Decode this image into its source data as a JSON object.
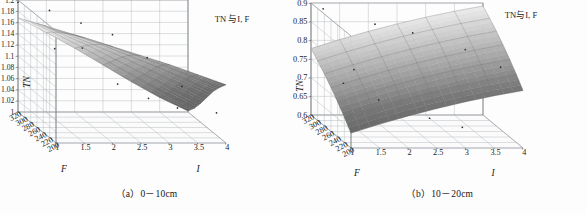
{
  "figure": {
    "background_color": "#fdfdfd",
    "panel_count": 2
  },
  "panels": [
    {
      "id": "a",
      "caption": "（a）0－10cm",
      "title": "TN 与I, F",
      "z_label": "TN",
      "x_label": "I",
      "y_label": "F"
    },
    {
      "id": "b",
      "caption": "（b）10－20cm",
      "title": "TN与I, F",
      "z_label": "TN",
      "x_label": "I",
      "y_label": "F"
    }
  ],
  "chart_data": [
    {
      "type": "surface",
      "panel": "a",
      "title": "TN 与I, F",
      "caption": "（a）0－10cm",
      "xlabel": "I",
      "ylabel": "F",
      "zlabel": "TN",
      "xlim": [
        1,
        4
      ],
      "ylim": [
        200,
        320
      ],
      "zlim": [
        1,
        1.2
      ],
      "x_ticks": [
        "1",
        "1.5",
        "2",
        "2.5",
        "3",
        "3.5",
        "4"
      ],
      "y_ticks": [
        "320",
        "300",
        "280",
        "260",
        "240",
        "220",
        "200"
      ],
      "z_ticks": [
        "1",
        "1.02",
        "1.04",
        "1.06",
        "1.08",
        "1.1",
        "1.12",
        "1.14",
        "1.16",
        "1.18",
        "1.2"
      ],
      "grid": true,
      "legend": "none",
      "surface_colormap": [
        "#f2f2f2",
        "#707070",
        "#2e2e2e"
      ],
      "x": [
        1,
        1.5,
        2,
        2.5,
        3,
        3.5,
        4
      ],
      "y": [
        200,
        220,
        240,
        260,
        280,
        300,
        320
      ],
      "z_matrix": [
        [
          1.2,
          1.188,
          1.172,
          1.156,
          1.14,
          1.122,
          1.104
        ],
        [
          1.196,
          1.182,
          1.166,
          1.148,
          1.13,
          1.11,
          1.09
        ],
        [
          1.192,
          1.176,
          1.158,
          1.138,
          1.118,
          1.096,
          1.074
        ],
        [
          1.186,
          1.168,
          1.148,
          1.126,
          1.102,
          1.078,
          1.054
        ],
        [
          1.18,
          1.16,
          1.138,
          1.112,
          1.086,
          1.06,
          1.034
        ],
        [
          1.174,
          1.152,
          1.126,
          1.098,
          1.07,
          1.042,
          1.016
        ],
        [
          1.168,
          1.142,
          1.114,
          1.084,
          1.054,
          1.026,
          1.002
        ]
      ],
      "scatter_points": [
        {
          "I": 1.0,
          "F": 320,
          "TN": 1.196
        },
        {
          "I": 1.5,
          "F": 310,
          "TN": 1.186
        },
        {
          "I": 2.0,
          "F": 300,
          "TN": 1.168
        },
        {
          "I": 2.5,
          "F": 290,
          "TN": 1.152
        },
        {
          "I": 3.0,
          "F": 270,
          "TN": 1.12
        },
        {
          "I": 3.5,
          "F": 250,
          "TN": 1.078
        },
        {
          "I": 4.0,
          "F": 230,
          "TN": 1.04
        },
        {
          "I": 1.2,
          "F": 240,
          "TN": 1.15
        },
        {
          "I": 2.2,
          "F": 220,
          "TN": 1.096
        },
        {
          "I": 3.2,
          "F": 210,
          "TN": 1.058
        },
        {
          "I": 1.8,
          "F": 260,
          "TN": 1.142
        },
        {
          "I": 2.8,
          "F": 230,
          "TN": 1.066
        }
      ]
    },
    {
      "type": "surface",
      "panel": "b",
      "title": "TN与I, F",
      "caption": "（b）10－20cm",
      "xlabel": "I",
      "ylabel": "F",
      "zlabel": "TN",
      "xlim": [
        1,
        4
      ],
      "ylim": [
        200,
        320
      ],
      "zlim": [
        0.6,
        0.9
      ],
      "x_ticks": [
        "1",
        "1.5",
        "2",
        "2.5",
        "3",
        "3.5",
        "4"
      ],
      "y_ticks": [
        "320",
        "300",
        "280",
        "260",
        "240",
        "220",
        "200"
      ],
      "z_ticks": [
        "0.6",
        "0.65",
        "0.7",
        "0.75",
        "0.8",
        "0.85",
        "0.9"
      ],
      "grid": true,
      "legend": "none",
      "surface_colormap": [
        "#f0f0f0",
        "#777777",
        "#333333"
      ],
      "x": [
        1,
        1.5,
        2,
        2.5,
        3,
        3.5,
        4
      ],
      "y": [
        200,
        220,
        240,
        260,
        280,
        300,
        320
      ],
      "z_matrix": [
        [
          0.64,
          0.664,
          0.686,
          0.706,
          0.724,
          0.74,
          0.754
        ],
        [
          0.668,
          0.692,
          0.714,
          0.734,
          0.752,
          0.768,
          0.782
        ],
        [
          0.694,
          0.718,
          0.74,
          0.76,
          0.778,
          0.794,
          0.808
        ],
        [
          0.718,
          0.742,
          0.764,
          0.784,
          0.802,
          0.818,
          0.832
        ],
        [
          0.74,
          0.764,
          0.786,
          0.806,
          0.824,
          0.84,
          0.854
        ],
        [
          0.76,
          0.784,
          0.806,
          0.826,
          0.844,
          0.86,
          0.874
        ],
        [
          0.778,
          0.802,
          0.824,
          0.844,
          0.862,
          0.878,
          0.892
        ]
      ],
      "scatter_points": [
        {
          "I": 1.2,
          "F": 318,
          "TN": 0.886
        },
        {
          "I": 2.0,
          "F": 300,
          "TN": 0.858
        },
        {
          "I": 2.6,
          "F": 290,
          "TN": 0.842
        },
        {
          "I": 3.4,
          "F": 270,
          "TN": 0.812
        },
        {
          "I": 3.9,
          "F": 250,
          "TN": 0.78
        },
        {
          "I": 1.1,
          "F": 240,
          "TN": 0.744
        },
        {
          "I": 1.6,
          "F": 220,
          "TN": 0.714
        },
        {
          "I": 2.4,
          "F": 205,
          "TN": 0.676
        },
        {
          "I": 3.0,
          "F": 210,
          "TN": 0.648
        },
        {
          "I": 1.4,
          "F": 260,
          "TN": 0.766
        }
      ]
    }
  ]
}
